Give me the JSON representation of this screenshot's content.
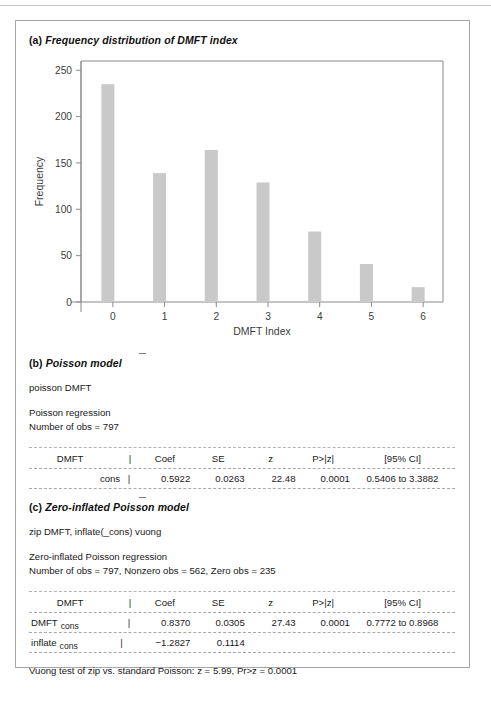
{
  "figure": {
    "panel_a": {
      "tag": "(a)",
      "title": "Frequency distribution of DMFT index"
    },
    "panel_b": {
      "tag": "(b)",
      "title": "Poisson model",
      "command": "poisson DMFT",
      "info_lines": [
        "Poisson regression",
        "Number of obs = 797"
      ],
      "table": {
        "headers": {
          "label": "DMFT",
          "pipe": "|",
          "coef": "Coef",
          "se": "SE",
          "z": "z",
          "p": "P>|z|",
          "ci": "[95% CI]"
        },
        "rows": [
          {
            "eq": "",
            "term": "cons",
            "pipe": "|",
            "coef": "0.5922",
            "se": "0.0263",
            "z": "22.48",
            "p": "0.0001",
            "ci": "0.5406 to 3.3882"
          }
        ]
      }
    },
    "panel_c": {
      "tag": "(c)",
      "title": "Zero-inflated Poisson model",
      "command": "zip DMFT, inflate(_cons) vuong",
      "info_lines": [
        "Zero-inflated Poisson regression",
        "Number of obs = 797, Nonzero obs = 562, Zero obs = 235"
      ],
      "table": {
        "headers": {
          "label": "DMFT",
          "pipe": "|",
          "coef": "Coef",
          "se": "SE",
          "z": "z",
          "p": "P>|z|",
          "ci": "[95% CI]"
        },
        "rows": [
          {
            "eq": "DMFT",
            "term": "cons",
            "pipe": "|",
            "coef": "0.8370",
            "se": "0.0305",
            "z": "27.43",
            "p": "0.0001",
            "ci": "0.7772 to 0.8968"
          },
          {
            "eq": "inflate",
            "term": "cons",
            "pipe": "|",
            "coef": "−1.2827",
            "se": "0.1114",
            "z": "",
            "p": "",
            "ci": ""
          }
        ]
      },
      "footnote": "Vuong test of zip vs. standard Poisson: z = 5.99, Pr>z = 0.0001"
    }
  },
  "chart_data": {
    "type": "bar",
    "title": "Frequency distribution of DMFT index",
    "xlabel": "DMFT Index",
    "ylabel": "Frequency",
    "categories": [
      "0",
      "1",
      "2",
      "3",
      "4",
      "5",
      "6"
    ],
    "values": [
      235,
      139,
      164,
      129,
      76,
      41,
      16
    ],
    "ylim": [
      0,
      260
    ],
    "yticks": [
      0,
      50,
      100,
      150,
      200,
      250
    ],
    "xticks": [
      "0",
      "1",
      "2",
      "3",
      "4",
      "5",
      "6"
    ],
    "grid": false,
    "legend": null,
    "bar_color": "#c9c9c9",
    "axis_color": "#8a8a8a"
  }
}
